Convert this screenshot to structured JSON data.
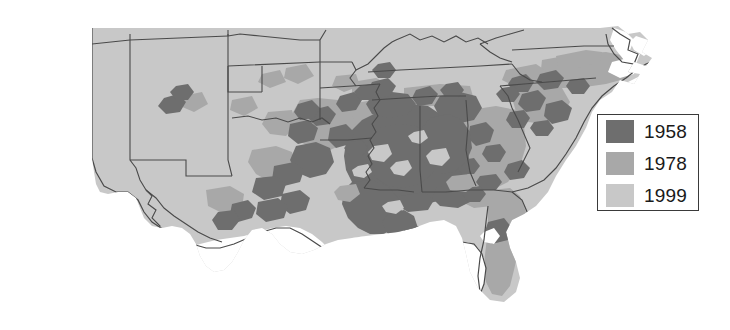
{
  "figure": {
    "type": "choropleth-map",
    "background_color": "#ffffff",
    "water_color": "#ffffff",
    "border_color": "#4a4a4a"
  },
  "legend": {
    "name": "map-legend",
    "border_color": "#3a3a3a",
    "background": "#ffffff",
    "items": [
      {
        "label": "1958",
        "color": "#6e6e6e"
      },
      {
        "label": "1978",
        "color": "#a8a8a8"
      },
      {
        "label": "1999",
        "color": "#c8c8c8"
      }
    ]
  },
  "map_data": {
    "shade_classes": {
      "dark": "#6e6e6e",
      "medium": "#a8a8a8",
      "light": "#c8c8c8"
    },
    "states": [
      {
        "name": "Arizona",
        "base_shade": "light"
      },
      {
        "name": "New Mexico",
        "base_shade": "light"
      },
      {
        "name": "Colorado",
        "base_shade": "light"
      },
      {
        "name": "Kansas",
        "base_shade": "light"
      },
      {
        "name": "Oklahoma",
        "base_shade": "light"
      },
      {
        "name": "Texas",
        "base_shade": "light"
      },
      {
        "name": "Missouri",
        "base_shade": "light"
      },
      {
        "name": "Arkansas",
        "base_shade": "medium"
      },
      {
        "name": "Louisiana",
        "base_shade": "dark"
      },
      {
        "name": "Mississippi",
        "base_shade": "dark"
      },
      {
        "name": "Alabama",
        "base_shade": "dark"
      },
      {
        "name": "Tennessee",
        "base_shade": "light"
      },
      {
        "name": "Kentucky",
        "base_shade": "light"
      },
      {
        "name": "Georgia",
        "base_shade": "medium"
      },
      {
        "name": "Florida",
        "base_shade": "medium"
      },
      {
        "name": "South Carolina",
        "base_shade": "medium"
      },
      {
        "name": "North Carolina",
        "base_shade": "medium"
      },
      {
        "name": "Virginia",
        "base_shade": "light"
      },
      {
        "name": "West Virginia",
        "base_shade": "light"
      }
    ]
  }
}
